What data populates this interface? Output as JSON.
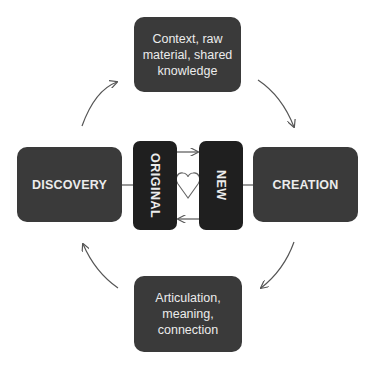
{
  "diagram": {
    "top_node": {
      "text": "Context, raw material, shared knowledge",
      "lines": [
        "Context, raw",
        "material, shared",
        "knowledge"
      ]
    },
    "left_node": {
      "text": "DISCOVERY"
    },
    "right_node": {
      "text": "CREATION"
    },
    "bottom_node": {
      "text": "Articulation, meaning, connection",
      "lines": [
        "Articulation,",
        "meaning,",
        "connection"
      ]
    },
    "center_left": {
      "text": "ORIGINAL"
    },
    "center_right": {
      "text": "NEW"
    },
    "center_icon": "heart-icon",
    "flow": [
      {
        "from": "DISCOVERY",
        "to": "top_node",
        "direction": "clockwise"
      },
      {
        "from": "top_node",
        "to": "CREATION",
        "direction": "clockwise"
      },
      {
        "from": "CREATION",
        "to": "bottom_node",
        "direction": "clockwise"
      },
      {
        "from": "bottom_node",
        "to": "DISCOVERY",
        "direction": "clockwise"
      },
      {
        "from": "ORIGINAL",
        "to": "NEW",
        "type": "arrow"
      },
      {
        "from": "NEW",
        "to": "ORIGINAL",
        "type": "arrow"
      }
    ],
    "colors": {
      "outer_box": "#3a3a3a",
      "inner_box": "#1f1f1f",
      "text": "#ececec",
      "lines": "#555555"
    }
  }
}
